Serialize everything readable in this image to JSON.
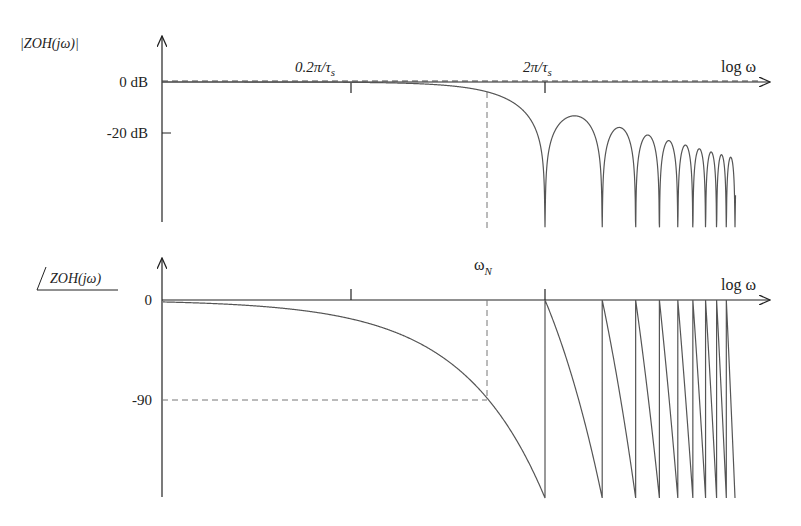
{
  "magnitude_plot": {
    "ylabel": "|ZOH(jω)|",
    "xlabel": "log ω",
    "ticks_y": [
      {
        "label": "0 dB",
        "value": 0
      },
      {
        "label": "-20 dB",
        "value": -20
      }
    ],
    "ticks_x": [
      {
        "label": "0.2π/τ",
        "sub": "s",
        "value": 0.1
      },
      {
        "label": "2π/τ",
        "sub": "s",
        "value": 1
      }
    ]
  },
  "phase_plot": {
    "ylabel": "ZOH(jω)",
    "xlabel": "log ω",
    "marker_label": "ω",
    "marker_sub": "N",
    "ticks_y": [
      {
        "label": "0",
        "value": 0
      },
      {
        "label": "-90",
        "value": -90
      }
    ]
  },
  "chart_data": [
    {
      "type": "line",
      "title": "Zero-order hold magnitude response",
      "ylabel": "|ZOH(jω)|",
      "xlabel": "log ω",
      "x_scale": "log",
      "x_units": "ω normalized to 2π/τs",
      "x_range": [
        0.0096,
        1.1
      ],
      "formula": "20·log10|sin(πf)/(πf)|",
      "y_ticks": [
        "0 dB",
        "-20 dB"
      ],
      "y_clip_dB": -57,
      "reference_line": {
        "value": 0,
        "style": "dashed"
      },
      "nulls_at_f": [
        1,
        2,
        3,
        4,
        5,
        6,
        7,
        8,
        9,
        10
      ],
      "sidelobe_peaks_dB": [
        -13.3,
        -17.8,
        -20.8,
        -23.0,
        -24.7,
        -26.2,
        -27.4,
        -28.5,
        -29.5
      ],
      "nyquist_marker": {
        "f": 0.5,
        "value_dB": -3.9,
        "style": "dashed"
      },
      "grid": false
    },
    {
      "type": "line",
      "title": "Zero-order hold phase response",
      "ylabel": "∠ZOH(jω)",
      "xlabel": "log ω",
      "x_scale": "log",
      "formula": "-180·f (deg), wrapping +180 at each null",
      "y_ticks": [
        "0",
        "-90"
      ],
      "y_range": [
        -180,
        0
      ],
      "sawtooth_resets_at_f": [
        1,
        2,
        3,
        4,
        5,
        6,
        7,
        8,
        9,
        10
      ],
      "nyquist_marker": {
        "label": "ωN",
        "f": 0.5,
        "value_deg": -90,
        "style": "dashed"
      },
      "grid": false
    }
  ]
}
